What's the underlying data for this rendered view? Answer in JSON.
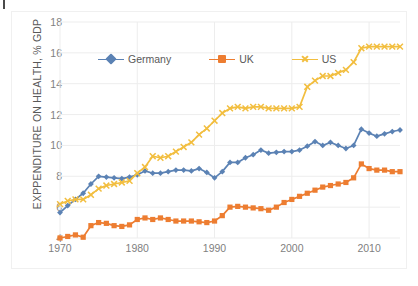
{
  "chart_data": {
    "type": "line",
    "title": "",
    "xlabel": "",
    "ylabel": "EXPPENDITURE ON HEALTH, % GDP",
    "xlim": [
      1970,
      2014
    ],
    "ylim": [
      4,
      18
    ],
    "xticks": [
      1970,
      1980,
      1990,
      2000,
      2010
    ],
    "yticks": [
      4,
      6,
      8,
      10,
      12,
      14,
      16,
      18
    ],
    "grid": "horizontal-and-vertical",
    "legend_position": "top-inside",
    "x": [
      1970,
      1971,
      1972,
      1973,
      1974,
      1975,
      1976,
      1977,
      1978,
      1979,
      1980,
      1981,
      1982,
      1983,
      1984,
      1985,
      1986,
      1987,
      1988,
      1989,
      1990,
      1991,
      1992,
      1993,
      1994,
      1995,
      1996,
      1997,
      1998,
      1999,
      2000,
      2001,
      2002,
      2003,
      2004,
      2005,
      2006,
      2007,
      2008,
      2009,
      2010,
      2011,
      2012,
      2013,
      2014
    ],
    "series": [
      {
        "name": "Germany",
        "color": "#5B82B4",
        "marker": "diamond",
        "values": [
          5.65,
          6.1,
          6.5,
          6.9,
          7.5,
          8.0,
          7.95,
          7.9,
          7.85,
          7.95,
          8.1,
          8.35,
          8.2,
          8.2,
          8.3,
          8.4,
          8.4,
          8.35,
          8.5,
          8.25,
          7.9,
          8.3,
          8.9,
          8.9,
          9.2,
          9.4,
          9.7,
          9.5,
          9.55,
          9.6,
          9.6,
          9.7,
          9.95,
          10.25,
          10.0,
          10.2,
          10.0,
          9.8,
          10.0,
          11.05,
          10.8,
          10.6,
          10.75,
          10.9,
          11.0
        ]
      },
      {
        "name": "UK",
        "color": "#ED7D31",
        "marker": "square",
        "values": [
          4.0,
          4.1,
          4.2,
          4.05,
          4.8,
          5.0,
          4.95,
          4.8,
          4.75,
          4.85,
          5.2,
          5.3,
          5.2,
          5.3,
          5.2,
          5.1,
          5.1,
          5.1,
          5.05,
          5.0,
          5.1,
          5.45,
          6.0,
          6.05,
          6.0,
          5.95,
          5.9,
          5.8,
          6.0,
          6.3,
          6.5,
          6.7,
          6.9,
          7.1,
          7.3,
          7.4,
          7.5,
          7.6,
          7.9,
          8.8,
          8.5,
          8.4,
          8.4,
          8.3,
          8.3
        ]
      },
      {
        "name": "US",
        "color": "#F2BE3F",
        "marker": "x",
        "values": [
          6.2,
          6.4,
          6.5,
          6.5,
          6.8,
          7.2,
          7.4,
          7.5,
          7.6,
          7.7,
          8.2,
          8.6,
          9.3,
          9.2,
          9.3,
          9.6,
          9.9,
          10.2,
          10.7,
          11.1,
          11.6,
          12.1,
          12.4,
          12.5,
          12.4,
          12.5,
          12.5,
          12.4,
          12.4,
          12.4,
          12.4,
          12.5,
          13.8,
          14.2,
          14.5,
          14.5,
          14.7,
          14.9,
          15.4,
          16.3,
          16.4,
          16.4,
          16.4,
          16.4,
          16.4
        ]
      }
    ]
  },
  "legend": {
    "items": [
      {
        "label": "Germany"
      },
      {
        "label": "UK"
      },
      {
        "label": "US"
      }
    ]
  },
  "axis": {
    "y_title": "EXPPENDITURE ON HEALTH, % GDP"
  },
  "colors": {
    "germany": "#5B82B4",
    "uk": "#ED7D31",
    "us": "#F2BE3F",
    "grid": "#EDEDED",
    "tick_text": "#7f7f7f",
    "axis_title": "#595959",
    "frame": "#f0f0f0"
  }
}
